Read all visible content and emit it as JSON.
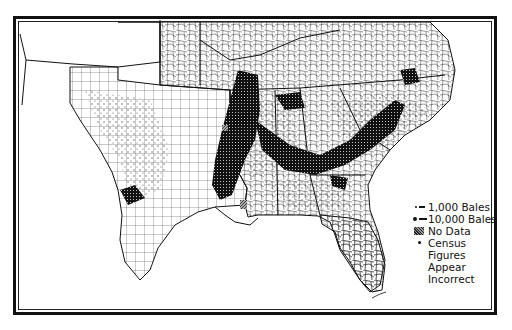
{
  "map": {
    "subject": "Cotton production by county, Southern United States (dot density)",
    "frame": "double-line border",
    "regions_visible": [
      "Texas",
      "Oklahoma",
      "Arkansas",
      "Louisiana",
      "Mississippi",
      "Alabama",
      "Georgia",
      "Florida",
      "South Carolina",
      "North Carolina",
      "Tennessee",
      "Kentucky",
      "Virginia",
      "Missouri"
    ],
    "colors": {
      "ink": "#111111",
      "background": "#ffffff",
      "hatch": "#999999"
    }
  },
  "legend": {
    "items": [
      {
        "symbol": "small-dot-dash",
        "label": "1,000 Bales"
      },
      {
        "symbol": "large-dot-dash",
        "label": "10,000 Bales"
      },
      {
        "symbol": "hatched-square",
        "label": "No Data"
      },
      {
        "symbol": "asterisk-dot",
        "label": "Census",
        "continuation": [
          "Figures",
          "Appear",
          "Incorrect"
        ]
      }
    ]
  }
}
